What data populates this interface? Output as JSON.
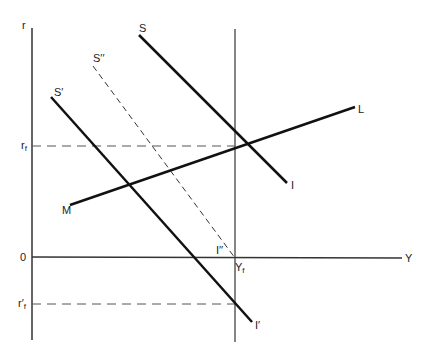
{
  "diagram": {
    "axes": {
      "y_label": "r",
      "x_label": "Y",
      "origin_label": "0"
    },
    "levels": {
      "rf": "r",
      "rf_sub": "f",
      "rf_prime": "r′",
      "rf_prime_sub": "f",
      "yf": "Y",
      "yf_sub": "f"
    },
    "curves": {
      "S": "S",
      "I": "I",
      "S_prime": "S′",
      "I_prime": "I′",
      "S_double": "S′′",
      "I_double": "I′′",
      "M": "M",
      "L": "L"
    },
    "colors": {
      "line": "#111111",
      "axis": "#333333",
      "dash": "#555555"
    }
  }
}
